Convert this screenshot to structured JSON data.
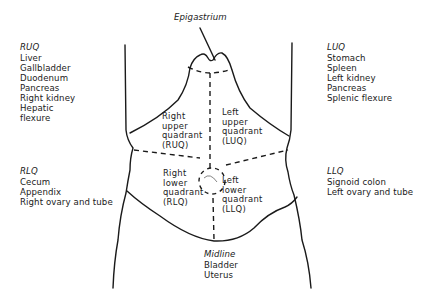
{
  "top_label": "Epigastrium",
  "regions": {
    "ruq": {
      "heading": "RUQ",
      "items": [
        "Liver",
        "Gallbladder",
        "Duodenum",
        "Pancreas",
        "Right kidney",
        "Hepatic",
        "flexure"
      ]
    },
    "luq": {
      "heading": "LUQ",
      "items": [
        "Stomach",
        "Spleen",
        "Left kidney",
        "Pancreas",
        "Splenic flexure"
      ]
    },
    "rlq": {
      "heading": "RLQ",
      "items": [
        "Cecum",
        "Appendix",
        "Right ovary and tube"
      ]
    },
    "llq": {
      "heading": "LLQ",
      "items": [
        "Signoid colon",
        "Left ovary and tube"
      ]
    },
    "midline": {
      "heading": "Midline",
      "items": [
        "Bladder",
        "Uterus"
      ]
    }
  },
  "quadrants": {
    "ruq": [
      "Right",
      "upper",
      "quadrant",
      "(RUQ)"
    ],
    "luq": [
      "Left",
      "upper",
      "quadrant",
      "(LUQ)"
    ],
    "rlq": [
      "Right",
      "lower",
      "quadrant",
      "(RLQ)"
    ],
    "llq": [
      "Left",
      "lower",
      "quadrant",
      "(LLQ)"
    ]
  },
  "colors": {
    "line": "#1a1a1a",
    "background": "#ffffff"
  }
}
